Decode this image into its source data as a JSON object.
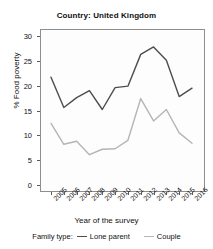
{
  "chart_data": {
    "type": "line",
    "title": "Country: United Kingdom",
    "xlabel": "Year of the survey",
    "ylabel": "% Food poverty",
    "categories": [
      "2005",
      "2006",
      "2007",
      "2008",
      "2009",
      "2010",
      "2011",
      "2012",
      "2013",
      "2014",
      "2015",
      "2016"
    ],
    "x": [
      2005,
      2006,
      2007,
      2008,
      2009,
      2010,
      2011,
      2012,
      2013,
      2014,
      2015,
      2016
    ],
    "series": [
      {
        "name": "Lone parent",
        "color": "#4d4d4d",
        "values": [
          21.7,
          15.6,
          17.6,
          19.0,
          15.2,
          19.6,
          19.9,
          26.3,
          27.8,
          25.1,
          17.8,
          19.5
        ]
      },
      {
        "name": "Couple",
        "color": "#b5b5b5",
        "values": [
          12.4,
          8.2,
          8.8,
          6.1,
          7.2,
          7.3,
          9.0,
          17.4,
          12.9,
          15.2,
          10.5,
          8.4
        ]
      }
    ],
    "ylim": [
      0,
      30
    ],
    "yticks": [
      0,
      5,
      10,
      15,
      20,
      25,
      30
    ],
    "ytick_labels": [
      "0",
      "5",
      "10",
      "15",
      "20",
      "25",
      "30"
    ],
    "xlim": [
      2005,
      2016
    ],
    "grid": false,
    "legend_position": "bottom",
    "legend_title": "Family type:"
  },
  "legend": {
    "title": "Family type:",
    "entries": [
      {
        "label": "Lone parent",
        "color": "#4d4d4d"
      },
      {
        "label": "Couple",
        "color": "#b5b5b5"
      }
    ]
  }
}
